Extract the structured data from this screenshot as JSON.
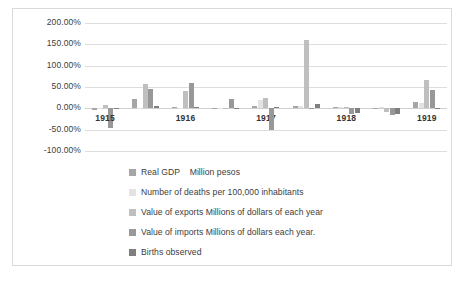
{
  "chart_data": {
    "type": "bar",
    "title": "",
    "subtitle": "",
    "xlabel": "",
    "ylabel": "",
    "grid": true,
    "legend_position": "bottom",
    "ylim": [
      -100,
      200
    ],
    "ytick_labels": [
      "200.00%",
      "150.00%",
      "100.00%",
      "50.00%",
      "0.00%",
      "-50.00%",
      "-100.00%"
    ],
    "ytick_values": [
      200,
      150,
      100,
      50,
      0,
      -50,
      -100
    ],
    "categories": [
      "1915",
      "1916",
      "1917",
      "1918",
      "1919",
      "1920",
      "1921",
      "1922",
      "1923"
    ],
    "series": [
      {
        "name": "Real GDP    Million pesos",
        "color": "#a6a6a6",
        "values": [
          -3,
          22,
          3,
          1,
          5,
          5,
          4,
          1,
          14
        ]
      },
      {
        "name": "Number of deaths per 100,000 inhabitants",
        "color": "#e3e3e3",
        "values": [
          0,
          1,
          1,
          1,
          20,
          6,
          3,
          4,
          12
        ]
      },
      {
        "name": "Value of exports Millions of dollars of each year",
        "color": "#bfbfbf",
        "values": [
          8,
          56,
          41,
          0,
          24,
          160,
          2,
          -9,
          67
        ]
      },
      {
        "name": "Value of imports Millions of dollars each year.",
        "color": "#989898",
        "values": [
          -45,
          46,
          59,
          21,
          -51,
          0,
          -14,
          -15,
          44
        ]
      },
      {
        "name": "Births observed",
        "color": "#7f7f7f",
        "values": [
          0,
          5,
          2,
          -1,
          4,
          10,
          -12,
          -14,
          1
        ]
      }
    ]
  }
}
